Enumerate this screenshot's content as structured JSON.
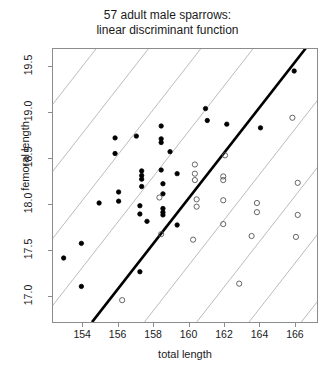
{
  "title": {
    "line1": "57 adult male sparrows:",
    "line2": "linear discriminant function"
  },
  "axes": {
    "xlabel": "total length",
    "ylabel": "femoral length",
    "xticks": [
      "154",
      "156",
      "158",
      "160",
      "162",
      "164",
      "166"
    ],
    "yticks": [
      "17.0",
      "17.5",
      "18.0",
      "18.5",
      "19.0",
      "19.5"
    ]
  },
  "chart_data": {
    "type": "scatter",
    "title": "57 adult male sparrows: linear discriminant function",
    "xlabel": "total length",
    "ylabel": "femoral length",
    "xlim": [
      152.3,
      167.3
    ],
    "ylim": [
      16.7,
      19.7
    ],
    "xticks": [
      154,
      156,
      158,
      160,
      162,
      164,
      166
    ],
    "yticks": [
      17.0,
      17.5,
      18.0,
      18.5,
      19.0,
      19.5
    ],
    "grid": false,
    "legend": "none",
    "series": [
      {
        "name": "survived",
        "marker": "filled-circle",
        "color": "#000000",
        "points": [
          [
            165.9,
            19.46
          ],
          [
            160.9,
            19.05
          ],
          [
            161.0,
            18.92
          ],
          [
            158.4,
            18.86
          ],
          [
            162.1,
            18.88
          ],
          [
            164.0,
            18.84
          ],
          [
            157.0,
            18.75
          ],
          [
            158.4,
            18.72
          ],
          [
            158.4,
            18.68
          ],
          [
            155.8,
            18.73
          ],
          [
            158.9,
            18.58
          ],
          [
            155.8,
            18.56
          ],
          [
            157.3,
            18.37
          ],
          [
            158.4,
            18.38
          ],
          [
            159.3,
            18.34
          ],
          [
            157.3,
            18.32
          ],
          [
            157.3,
            18.28
          ],
          [
            158.5,
            18.23
          ],
          [
            157.3,
            18.2
          ],
          [
            156.0,
            18.14
          ],
          [
            158.5,
            18.12
          ],
          [
            156.0,
            18.04
          ],
          [
            154.9,
            18.02
          ],
          [
            157.2,
            17.99
          ],
          [
            158.5,
            17.96
          ],
          [
            158.5,
            17.92
          ],
          [
            158.5,
            17.89
          ],
          [
            157.2,
            17.9
          ],
          [
            157.6,
            17.82
          ],
          [
            159.3,
            17.78
          ],
          [
            153.9,
            17.58
          ],
          [
            152.9,
            17.42
          ],
          [
            157.2,
            17.27
          ],
          [
            153.9,
            17.11
          ]
        ]
      },
      {
        "name": "perished",
        "marker": "open-circle",
        "color": "#555555",
        "points": [
          [
            165.8,
            18.95
          ],
          [
            162.0,
            18.54
          ],
          [
            160.3,
            18.44
          ],
          [
            160.3,
            18.34
          ],
          [
            161.9,
            18.31
          ],
          [
            160.3,
            18.27
          ],
          [
            161.9,
            18.27
          ],
          [
            166.1,
            18.24
          ],
          [
            160.4,
            18.06
          ],
          [
            161.9,
            18.05
          ],
          [
            163.8,
            18.02
          ],
          [
            160.4,
            17.98
          ],
          [
            163.8,
            17.92
          ],
          [
            166.1,
            17.89
          ],
          [
            161.9,
            17.79
          ],
          [
            158.4,
            17.68
          ],
          [
            163.5,
            17.66
          ],
          [
            166.0,
            17.65
          ],
          [
            158.3,
            18.08
          ],
          [
            160.2,
            17.62
          ],
          [
            162.8,
            17.14
          ],
          [
            156.2,
            16.96
          ]
        ]
      }
    ],
    "discriminant_line": {
      "name": "linear discriminant boundary",
      "color": "#000000",
      "width": 2.6,
      "x1": 154.5,
      "y1": 16.72,
      "x2": 166.6,
      "y2": 19.72
    },
    "parallel_lines": {
      "name": "parallel iso-discriminant lines",
      "color": "#aaaaaa",
      "width": 0.8,
      "slope_per_x_unit": 0.248,
      "offsets_at_y_intercepts": [
        -3.0,
        -2.0,
        -1.0,
        0.0,
        1.0,
        2.0,
        3.0
      ]
    }
  }
}
